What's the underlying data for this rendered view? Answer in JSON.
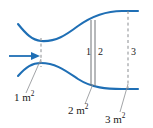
{
  "figure": {
    "name": "duct-flow-cross-section-diagram",
    "colors": {
      "duct_wall": "#1f6fb5",
      "flow_arrow": "#1f6fb5",
      "station_line": "#6f7276",
      "dashed_line": "#8a8d91",
      "leader_line": "#8a8d91",
      "text": "#1a1a1a",
      "background": "#ffffff"
    }
  },
  "flow": {
    "arrow_icon": "right-arrow-icon",
    "direction": "right"
  },
  "stations": [
    {
      "id": "1",
      "label": "1",
      "line_style": "solid"
    },
    {
      "id": "2",
      "label": "2",
      "line_style": "solid"
    },
    {
      "id": "3",
      "label": "3",
      "line_style": "dashed"
    }
  ],
  "areas": [
    {
      "id": "a1",
      "value": "1",
      "unit": "m",
      "exponent": "2",
      "text": "1 m"
    },
    {
      "id": "a2",
      "value": "2",
      "unit": "m",
      "exponent": "2",
      "text": "2 m"
    },
    {
      "id": "a3",
      "value": "3",
      "unit": "m",
      "exponent": "2",
      "text": "3 m"
    }
  ],
  "superscript": "2"
}
